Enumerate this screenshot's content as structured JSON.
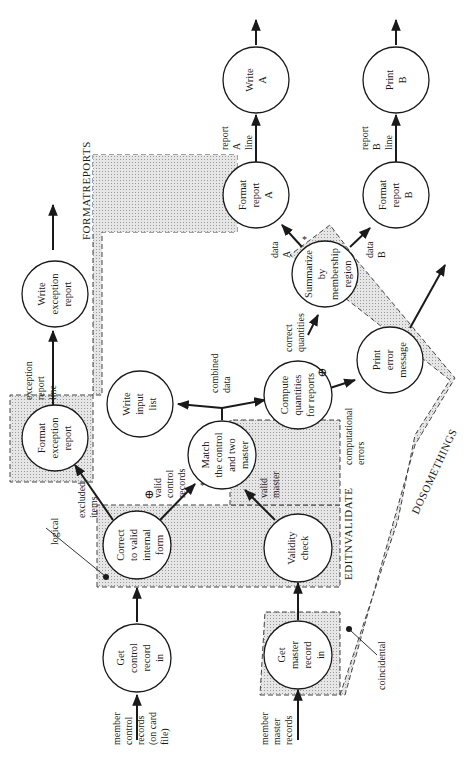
{
  "diagram": {
    "orientation": "rotated 90deg counterclockwise",
    "colors": {
      "ink": "#1a1a1a",
      "region_fill": "#d9d9d9",
      "background": "#ffffff"
    },
    "regions": {
      "formatreports": "FORMATREPORTS",
      "editnvalidate": "EDITNVALIDATE",
      "dosomethings": "DOSOMETHINGS"
    },
    "annotations": {
      "logical": "logical",
      "coincidental": "coincidental",
      "plus1": "⊕",
      "plus2": "⊕",
      "star1": "*",
      "star2": "*"
    },
    "nodes": {
      "get_control": [
        "Get",
        "control",
        "record",
        "in"
      ],
      "correct_valid": [
        "Correct",
        "to valid",
        "internal",
        "form"
      ],
      "format_exception": [
        "Format",
        "exception",
        "report"
      ],
      "write_exception": [
        "Write",
        "exception",
        "report"
      ],
      "match": [
        "Match",
        "the control",
        "and two",
        "master"
      ],
      "write_input": [
        "Write",
        "input",
        "list"
      ],
      "get_master": [
        "Get",
        "master",
        "record",
        "in"
      ],
      "validity": [
        "Validity",
        "check"
      ],
      "compute": [
        "Compute",
        "quantities",
        "for reports"
      ],
      "print_error": [
        "Print",
        "error",
        "message"
      ],
      "summarize": [
        "Summarize",
        "by",
        "membership",
        "region"
      ],
      "format_a": [
        "Format",
        "report",
        "A"
      ],
      "format_b": [
        "Format",
        "report",
        "B"
      ],
      "write_a": [
        "Write",
        "A"
      ],
      "print_b": [
        "Print",
        "B"
      ]
    },
    "flows": {
      "member_control": [
        "member",
        "control",
        "records",
        "(on card",
        "file)"
      ],
      "member_master": [
        "member",
        "master",
        "records"
      ],
      "excluded_items": [
        "excluded",
        "items"
      ],
      "exception_line": [
        "exception",
        "report",
        "line"
      ],
      "valid_control": [
        "valid",
        "control",
        "records"
      ],
      "valid_master": [
        "valid",
        "master"
      ],
      "combined_data": [
        "combined",
        "data"
      ],
      "computational_errors": [
        "computational",
        "errors"
      ],
      "correct_quantities": [
        "correct",
        "quantities"
      ],
      "data_a": [
        "data",
        "A"
      ],
      "data_b": [
        "data",
        "B"
      ],
      "report_a_line": [
        "report",
        "A",
        "line"
      ],
      "report_b_line": [
        "report",
        "B",
        "line"
      ]
    }
  }
}
